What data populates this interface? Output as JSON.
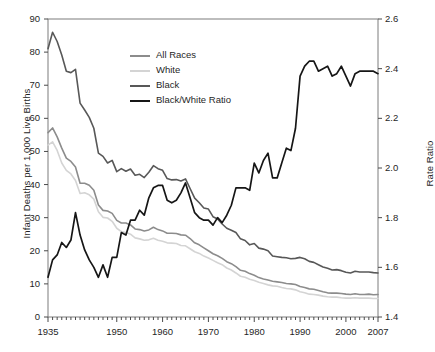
{
  "chart_data": {
    "type": "line",
    "title": "",
    "xlabel": "",
    "ylabel": "Infant Deaths per 1,000 Live Births",
    "y2label": "Rate Ratio",
    "xlim": [
      1935,
      2007
    ],
    "ylim": [
      0,
      90
    ],
    "y2lim": [
      1.4,
      2.6
    ],
    "grid": false,
    "legend_position": "top-center",
    "x_ticks": [
      "1935",
      "1950",
      "1960",
      "1970",
      "1980",
      "1990",
      "2000",
      "2007"
    ],
    "x_tick_values": [
      1935,
      1950,
      1960,
      1970,
      1980,
      1990,
      2000,
      2007
    ],
    "y_ticks": [
      "0",
      "10",
      "20",
      "30",
      "40",
      "50",
      "60",
      "70",
      "80",
      "90"
    ],
    "y_tick_values": [
      0,
      10,
      20,
      30,
      40,
      50,
      60,
      70,
      80,
      90
    ],
    "y2_ticks": [
      "1.4",
      "1.6",
      "1.8",
      "2.0",
      "2.2",
      "2.4",
      "2.6"
    ],
    "y2_tick_values": [
      1.4,
      1.6,
      1.8,
      2.0,
      2.2,
      2.4,
      2.6
    ],
    "x": [
      1935,
      1936,
      1937,
      1938,
      1939,
      1940,
      1941,
      1942,
      1943,
      1944,
      1945,
      1946,
      1947,
      1948,
      1949,
      1950,
      1951,
      1952,
      1953,
      1954,
      1955,
      1956,
      1957,
      1958,
      1959,
      1960,
      1961,
      1962,
      1963,
      1964,
      1965,
      1966,
      1967,
      1968,
      1969,
      1970,
      1971,
      1972,
      1973,
      1974,
      1975,
      1976,
      1977,
      1978,
      1979,
      1980,
      1981,
      1982,
      1983,
      1984,
      1985,
      1986,
      1987,
      1988,
      1989,
      1990,
      1991,
      1992,
      1993,
      1994,
      1995,
      1996,
      1997,
      1998,
      1999,
      2000,
      2001,
      2002,
      2003,
      2004,
      2005,
      2006,
      2007
    ],
    "series": [
      {
        "name": "All Races",
        "axis": "left",
        "color": "#8c8c8c",
        "values": [
          55.7,
          57.1,
          54.4,
          51.0,
          48.0,
          47.0,
          45.3,
          40.4,
          40.4,
          39.8,
          38.3,
          33.8,
          32.2,
          32.0,
          31.3,
          29.2,
          28.4,
          28.4,
          27.8,
          26.6,
          26.4,
          26.0,
          26.3,
          27.1,
          26.4,
          26.0,
          25.3,
          25.3,
          25.2,
          24.8,
          24.7,
          23.7,
          22.4,
          21.8,
          20.9,
          20.0,
          19.1,
          18.5,
          17.7,
          16.7,
          16.1,
          15.2,
          14.1,
          13.8,
          13.1,
          12.6,
          11.9,
          11.5,
          11.2,
          10.8,
          10.6,
          10.4,
          10.1,
          10.0,
          9.8,
          9.2,
          8.9,
          8.5,
          8.4,
          8.0,
          7.6,
          7.3,
          7.2,
          7.2,
          7.1,
          6.9,
          6.8,
          7.0,
          6.8,
          6.8,
          6.9,
          6.7,
          6.8
        ]
      },
      {
        "name": "White",
        "axis": "left",
        "color": "#d4d4d4",
        "values": [
          51.9,
          52.9,
          50.3,
          46.5,
          44.3,
          43.2,
          41.2,
          37.3,
          37.5,
          36.9,
          35.6,
          31.8,
          30.1,
          29.9,
          28.9,
          26.8,
          25.8,
          25.5,
          25.0,
          23.9,
          23.6,
          23.2,
          23.3,
          23.8,
          23.2,
          22.9,
          22.4,
          22.3,
          22.2,
          21.6,
          21.5,
          20.6,
          19.7,
          19.2,
          18.4,
          17.8,
          17.1,
          16.4,
          15.8,
          14.8,
          14.2,
          13.3,
          12.3,
          12.0,
          11.4,
          11.0,
          10.5,
          10.1,
          9.7,
          9.4,
          9.3,
          8.9,
          8.6,
          8.5,
          8.2,
          7.6,
          7.3,
          6.9,
          6.8,
          6.6,
          6.3,
          6.1,
          6.0,
          6.0,
          5.8,
          5.7,
          5.7,
          5.8,
          5.7,
          5.7,
          5.7,
          5.6,
          5.6
        ]
      },
      {
        "name": "Black",
        "axis": "left",
        "color": "#585858",
        "values": [
          81.0,
          86.0,
          83.2,
          79.1,
          74.2,
          73.8,
          74.8,
          64.6,
          62.5,
          60.3,
          57.0,
          49.5,
          48.5,
          46.5,
          47.3,
          43.9,
          44.8,
          44.0,
          44.7,
          42.8,
          43.1,
          42.1,
          43.7,
          45.7,
          44.8,
          44.3,
          41.8,
          41.4,
          41.5,
          41.1,
          41.7,
          38.8,
          35.9,
          34.5,
          32.9,
          32.6,
          30.3,
          29.6,
          28.1,
          26.8,
          26.2,
          25.5,
          23.6,
          23.1,
          21.8,
          22.2,
          20.8,
          20.5,
          20.0,
          18.4,
          18.2,
          18.0,
          17.9,
          17.6,
          17.7,
          18.0,
          17.6,
          16.8,
          16.5,
          15.8,
          15.1,
          14.7,
          14.2,
          14.3,
          14.0,
          13.5,
          13.3,
          13.8,
          13.6,
          13.6,
          13.6,
          13.4,
          13.3
        ]
      },
      {
        "name": "Black/White Ratio",
        "axis": "right",
        "color": "#161616",
        "values": [
          1.56,
          1.63,
          1.65,
          1.7,
          1.68,
          1.71,
          1.82,
          1.73,
          1.67,
          1.63,
          1.6,
          1.56,
          1.61,
          1.56,
          1.64,
          1.64,
          1.74,
          1.73,
          1.79,
          1.79,
          1.83,
          1.81,
          1.88,
          1.92,
          1.93,
          1.93,
          1.87,
          1.86,
          1.87,
          1.9,
          1.94,
          1.88,
          1.82,
          1.8,
          1.79,
          1.79,
          1.77,
          1.8,
          1.78,
          1.81,
          1.85,
          1.92,
          1.92,
          1.92,
          1.91,
          2.02,
          1.98,
          2.03,
          2.06,
          1.96,
          1.96,
          2.02,
          2.08,
          2.07,
          2.16,
          2.37,
          2.41,
          2.43,
          2.43,
          2.39,
          2.4,
          2.41,
          2.37,
          2.38,
          2.41,
          2.37,
          2.33,
          2.38,
          2.39,
          2.39,
          2.39,
          2.39,
          2.38
        ]
      }
    ]
  },
  "legend": {
    "items": [
      {
        "label": "All Races",
        "color": "#8c8c8c",
        "width": 2.0
      },
      {
        "label": "White",
        "color": "#d4d4d4",
        "width": 2.0
      },
      {
        "label": "Black",
        "color": "#585858",
        "width": 2.0
      },
      {
        "label": "Black/White Ratio",
        "color": "#161616",
        "width": 2.6
      }
    ]
  },
  "caption": ""
}
